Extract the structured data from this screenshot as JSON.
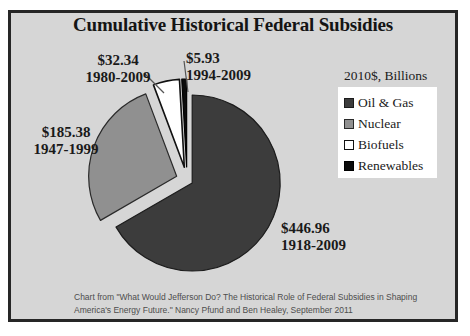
{
  "window": {
    "background": "#ffffff",
    "frame_background": "#d6d6d6",
    "frame_border_color": "#262626"
  },
  "chart_data": {
    "type": "pie",
    "title": "Cumulative Historical Federal Subsidies",
    "unit_label": "2010$, Billions",
    "legend_position": "right",
    "start_angle_deg": 0,
    "direction": "clockwise",
    "total": 670.61,
    "slices": [
      {
        "label": "Oil & Gas",
        "value": 446.96,
        "amount_label": "$446.96",
        "period": "1918-2009",
        "color": "#3c3c3c",
        "outline": "#1c1c1c",
        "explode_px": 6
      },
      {
        "label": "Nuclear",
        "value": 185.38,
        "amount_label": "$185.38",
        "period": "1947-1999",
        "color": "#909090",
        "outline": "#2a2a2a",
        "explode_px": 11
      },
      {
        "label": "Biofuels",
        "value": 32.34,
        "amount_label": "$32.34",
        "period": "1980-2009",
        "color": "#ffffff",
        "outline": "#111111",
        "explode_px": 13
      },
      {
        "label": "Renewables",
        "value": 5.93,
        "amount_label": "$5.93",
        "period": "1994-2009",
        "color": "#0b0b0b",
        "outline": "#000000",
        "explode_px": 13
      }
    ]
  },
  "caption": {
    "line1": "Chart from \"What Would Jefferson Do? The Historical Role of Federal Subsidies in Shaping",
    "line2": "America's Energy Future.\" Nancy Pfund and Ben Healey, September 2011"
  }
}
